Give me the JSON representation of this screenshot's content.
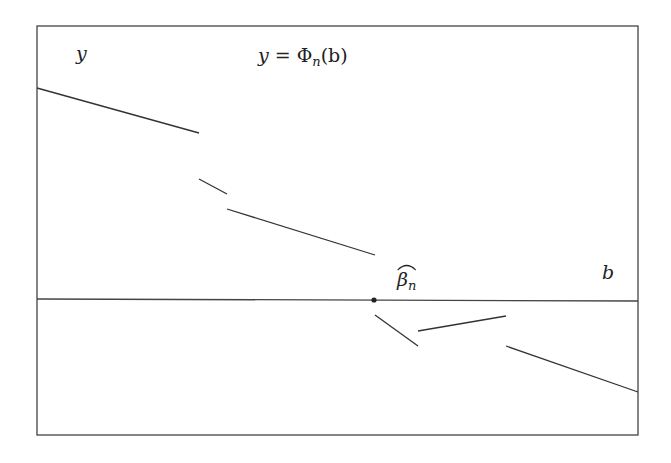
{
  "diagram": {
    "type": "piecewise-function-plot",
    "labels": {
      "y_axis": "y",
      "x_axis": "b",
      "title_lhs": "y = ",
      "title_fn": "Φ",
      "title_sub": "n",
      "title_arg": "(b)",
      "estimator_symbol": "β",
      "estimator_sub": "n"
    },
    "frame": {
      "x1": 37,
      "y1": 26,
      "x2": 638,
      "y2": 435
    },
    "x_axis_line": {
      "x1": 37,
      "y1": 299,
      "x2": 638,
      "y2": 301
    },
    "root_point": {
      "x": 374,
      "y": 300,
      "label": "β̂_n"
    },
    "segments": [
      {
        "x1": 37,
        "y1": 88,
        "x2": 199,
        "y2": 133
      },
      {
        "x1": 199,
        "y1": 179,
        "x2": 227,
        "y2": 194
      },
      {
        "x1": 227,
        "y1": 209,
        "x2": 375,
        "y2": 255
      },
      {
        "x1": 375,
        "y1": 315,
        "x2": 418,
        "y2": 346
      },
      {
        "x1": 418,
        "y1": 331,
        "x2": 506,
        "y2": 316
      },
      {
        "x1": 506,
        "y1": 346,
        "x2": 638,
        "y2": 392
      }
    ],
    "colors": {
      "line": "#333333",
      "frame": "#444444",
      "background": "#ffffff"
    }
  }
}
